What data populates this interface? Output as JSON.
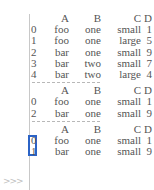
{
  "console": {
    "tables": [
      {
        "columns": [
          "A",
          "B",
          "C",
          "D"
        ],
        "rows": [
          {
            "index": "0",
            "A": "foo",
            "B": "one",
            "C": "small",
            "D": "1"
          },
          {
            "index": "1",
            "A": "foo",
            "B": "one",
            "C": "large",
            "D": "5"
          },
          {
            "index": "2",
            "A": "bar",
            "B": "one",
            "C": "small",
            "D": "9"
          },
          {
            "index": "3",
            "A": "bar",
            "B": "two",
            "C": "small",
            "D": "7"
          },
          {
            "index": "4",
            "A": "bar",
            "B": "two",
            "C": "large",
            "D": "4"
          }
        ]
      },
      {
        "columns": [
          "A",
          "B",
          "C",
          "D"
        ],
        "rows": [
          {
            "index": "0",
            "A": "foo",
            "B": "one",
            "C": "small",
            "D": "1"
          },
          {
            "index": "2",
            "A": "bar",
            "B": "one",
            "C": "small",
            "D": "9"
          }
        ]
      },
      {
        "columns": [
          "A",
          "B",
          "C",
          "D"
        ],
        "rows": [
          {
            "index": "0",
            "A": "foo",
            "B": "one",
            "C": "small",
            "D": "1"
          },
          {
            "index": "1",
            "A": "bar",
            "B": "one",
            "C": "small",
            "D": "9"
          }
        ]
      }
    ],
    "prompt": ">>>",
    "highlight_color": "#2b63c6"
  }
}
